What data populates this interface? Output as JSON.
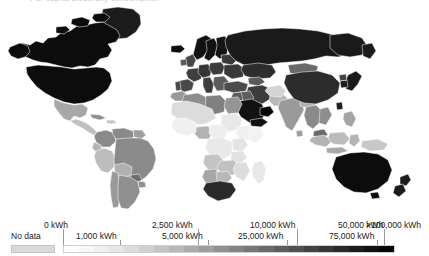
{
  "page": {
    "clipped_title": "Per capita electricity consumption",
    "background_color": "#ffffff"
  },
  "map": {
    "name": "world-choropleth-map",
    "projection": "equirectangular-style",
    "ocean_color": "#ffffff",
    "border_color": "#ffffff",
    "no_data_color": "#d9d9d9"
  },
  "legend": {
    "no_data_label": "No data",
    "no_data_color": "#d9d9d9",
    "bar_start_x": 63,
    "bar_end_x": 395,
    "top_labels": [
      {
        "text": "0 kWh",
        "x": 44,
        "tick_x": 63
      },
      {
        "text": "2,500 kWh",
        "x": 152,
        "tick_x": 198
      },
      {
        "text": "10,000 kWh",
        "x": 250,
        "tick_x": 297
      },
      {
        "text": "50,000 kWh",
        "x": 338,
        "tick_x": 384
      },
      {
        "text": ">100,000 kWh",
        "x": 366,
        "tick_x": 395
      }
    ],
    "bottom_labels": [
      {
        "text": "1,000 kWh",
        "x": 76,
        "tick_x": 120
      },
      {
        "text": "5,000 kWh",
        "x": 162,
        "tick_x": 208
      },
      {
        "text": "25,000 kWh",
        "x": 238,
        "tick_x": 287
      },
      {
        "text": "75,000 kWh",
        "x": 329,
        "tick_x": 377
      }
    ],
    "gradient_colors": [
      "#ffffff",
      "#f7f7f7",
      "#efefef",
      "#e6e6e6",
      "#dcdcdc",
      "#d0d0d0",
      "#c4c4c4",
      "#b8b8b8",
      "#ababab",
      "#9e9e9e",
      "#919191",
      "#848484",
      "#777777",
      "#6a6a6a",
      "#5d5d5d",
      "#505050",
      "#434343",
      "#363636",
      "#292929",
      "#1c1c1c",
      "#101010",
      "#060606"
    ]
  },
  "chart_data": {
    "type": "heatmap",
    "title": "Per capita electricity consumption",
    "unit": "kWh",
    "scale_type": "stepped-sequential-grayscale",
    "xlabel": "",
    "ylabel": "",
    "legend_position": "bottom",
    "grid": false,
    "breaks": [
      0,
      1000,
      2500,
      5000,
      10000,
      25000,
      50000,
      75000,
      100000
    ],
    "break_labels": [
      "0 kWh",
      "1,000 kWh",
      "2,500 kWh",
      "5,000 kWh",
      "10,000 kWh",
      "25,000 kWh",
      "50,000 kWh",
      "75,000 kWh",
      ">100,000 kWh"
    ],
    "categories": [
      "Canada",
      "United States",
      "Mexico",
      "Greenland",
      "Brazil",
      "Argentina",
      "Chile",
      "Peru",
      "Bolivia",
      "Colombia",
      "Venezuela",
      "Russia",
      "Norway",
      "Sweden",
      "Finland",
      "Iceland",
      "United Kingdom",
      "France",
      "Germany",
      "Spain",
      "Italy",
      "Poland",
      "Ukraine",
      "Turkey",
      "Saudi Arabia",
      "Qatar",
      "United Arab Emirates",
      "Kuwait",
      "Iran",
      "Iraq",
      "Egypt",
      "Libya",
      "Algeria",
      "Morocco",
      "Nigeria",
      "Ethiopia",
      "Kenya",
      "Tanzania",
      "Democratic Republic of Congo",
      "South Africa",
      "Namibia",
      "Botswana",
      "Zimbabwe",
      "Madagascar",
      "India",
      "China",
      "Japan",
      "South Korea",
      "Mongolia",
      "Kazakhstan",
      "Indonesia",
      "Thailand",
      "Vietnam",
      "Malaysia",
      "Philippines",
      "Australia",
      "New Zealand",
      "Papua New Guinea"
    ],
    "values": [
      75000,
      50000,
      5000,
      25000,
      5000,
      5000,
      10000,
      5000,
      2500,
      5000,
      5000,
      50000,
      75000,
      75000,
      75000,
      100000,
      25000,
      25000,
      25000,
      25000,
      25000,
      25000,
      25000,
      10000,
      50000,
      100000,
      75000,
      75000,
      25000,
      10000,
      5000,
      5000,
      5000,
      2500,
      500,
      200,
      500,
      200,
      200,
      25000,
      10000,
      5000,
      2500,
      200,
      2500,
      25000,
      50000,
      50000,
      10000,
      25000,
      2500,
      5000,
      5000,
      10000,
      2500,
      75000,
      25000,
      500
    ]
  }
}
